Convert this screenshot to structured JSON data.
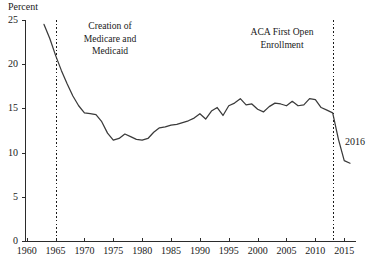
{
  "chart_data": {
    "type": "line",
    "title": "",
    "subtitle": "",
    "ylabel": "Percent",
    "xlabel": "",
    "xlim": [
      1960,
      2017
    ],
    "ylim": [
      0,
      25
    ],
    "grid": false,
    "legend": "none",
    "y_ticks": [
      25,
      20,
      15,
      10,
      5,
      0
    ],
    "x_ticks": [
      1960,
      1965,
      1970,
      1975,
      1980,
      1985,
      1990,
      1995,
      2000,
      2005,
      2010,
      2015
    ],
    "series": [
      {
        "name": "Uninsured share of population",
        "x": [
          1963,
          1964,
          1965,
          1966,
          1967,
          1968,
          1969,
          1970,
          1971,
          1972,
          1973,
          1974,
          1975,
          1976,
          1977,
          1978,
          1979,
          1980,
          1981,
          1982,
          1983,
          1984,
          1985,
          1986,
          1987,
          1988,
          1989,
          1990,
          1991,
          1992,
          1993,
          1994,
          1995,
          1996,
          1997,
          1998,
          1999,
          2000,
          2001,
          2002,
          2003,
          2004,
          2005,
          2006,
          2007,
          2008,
          2009,
          2010,
          2011,
          2012,
          2013,
          2014,
          2015,
          2016
        ],
        "values": [
          24.5,
          22.9,
          21.0,
          19.3,
          17.8,
          16.4,
          15.3,
          14.5,
          14.4,
          14.3,
          13.5,
          12.2,
          11.4,
          11.6,
          12.1,
          11.8,
          11.5,
          11.4,
          11.6,
          12.3,
          12.8,
          12.9,
          13.1,
          13.2,
          13.4,
          13.6,
          13.9,
          14.4,
          13.8,
          14.7,
          15.1,
          14.2,
          15.3,
          15.6,
          16.1,
          15.4,
          15.5,
          14.9,
          14.6,
          15.2,
          15.6,
          15.5,
          15.3,
          15.8,
          15.3,
          15.4,
          16.1,
          16.0,
          15.1,
          14.8,
          14.5,
          11.5,
          9.1,
          8.8
        ]
      }
    ],
    "annotations": [
      {
        "name": "medicare-medicaid-annotation",
        "text_lines": [
          "Creation of",
          "Medicare and",
          "Medicaid"
        ],
        "event_year": 1965,
        "line_top_value": 25,
        "line_bottom_value": 0
      },
      {
        "name": "aca-annotation",
        "text_lines": [
          "ACA First Open",
          "Enrollment"
        ],
        "event_year": 2013,
        "line_top_value": 25,
        "line_bottom_value": 0
      }
    ],
    "point_labels": [
      {
        "name": "endpoint-2016-label",
        "text": "2016",
        "x": 2016,
        "y": 8.8
      }
    ],
    "colors": {
      "line": "#3a3a3a",
      "axis": "#2b2b2b",
      "text": "#1a1a1a",
      "background": "#ffffff"
    }
  },
  "y_tick_labels": [
    "25",
    "20",
    "15",
    "10",
    "5",
    "0"
  ],
  "x_tick_labels": [
    "1960",
    "1965",
    "1970",
    "1975",
    "1980",
    "1985",
    "1990",
    "1995",
    "2000",
    "2005",
    "2010",
    "2015"
  ],
  "axis_title": {
    "y": "Percent"
  },
  "annotation_text": {
    "medicare_line1": "Creation of",
    "medicare_line2": "Medicare and",
    "medicare_line3": "Medicaid",
    "aca_line1": "ACA First Open",
    "aca_line2": "Enrollment"
  },
  "endpoint": {
    "label": "2016"
  }
}
